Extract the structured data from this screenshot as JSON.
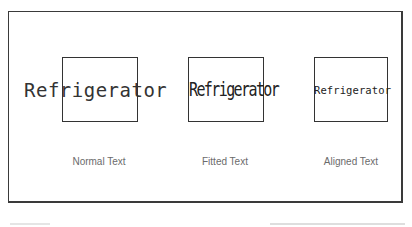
{
  "diagram": {
    "samples": [
      {
        "text": "Refrigerator",
        "caption": "Normal Text",
        "mode": "normal"
      },
      {
        "text": "Refrigerator",
        "caption": "Fitted Text",
        "mode": "fitted"
      },
      {
        "text": "Refrigerator",
        "caption": "Aligned Text",
        "mode": "aligned"
      }
    ],
    "colors": {
      "stroke": "#333333",
      "caption": "#6b6b6b",
      "background": "#ffffff"
    }
  }
}
